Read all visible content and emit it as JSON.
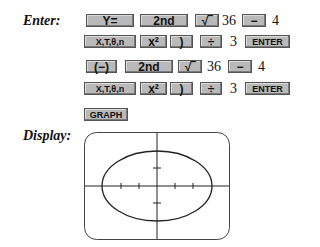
{
  "labels": {
    "enter": "Enter:",
    "display": "Display:"
  },
  "rows": [
    [
      {
        "type": "key",
        "label": "Y="
      },
      {
        "type": "key",
        "label": "2nd"
      },
      {
        "type": "key",
        "label": "√‾"
      },
      {
        "type": "text",
        "label": "36"
      },
      {
        "type": "key",
        "label": "−"
      },
      {
        "type": "text",
        "label": "4"
      }
    ],
    [
      {
        "type": "key",
        "label": "X,T,θ,n"
      },
      {
        "type": "key",
        "label": "x²"
      },
      {
        "type": "key",
        "label": ")"
      },
      {
        "type": "key",
        "label": "÷"
      },
      {
        "type": "text",
        "label": "3"
      },
      {
        "type": "key",
        "label": "ENTER"
      }
    ],
    [
      {
        "type": "key",
        "label": "(−)"
      },
      {
        "type": "key",
        "label": "2nd"
      },
      {
        "type": "key",
        "label": "√‾"
      },
      {
        "type": "text",
        "label": "36"
      },
      {
        "type": "key",
        "label": "−"
      },
      {
        "type": "text",
        "label": "4"
      }
    ],
    [
      {
        "type": "key",
        "label": "X,T,θ,n"
      },
      {
        "type": "key",
        "label": "x²"
      },
      {
        "type": "key",
        "label": ")"
      },
      {
        "type": "key",
        "label": "÷"
      },
      {
        "type": "text",
        "label": "3"
      },
      {
        "type": "key",
        "label": "ENTER"
      }
    ],
    [
      {
        "type": "key",
        "label": "GRAPH"
      }
    ]
  ],
  "display": {
    "graph": "ellipse",
    "x_ticks": [
      -2,
      -1,
      1,
      2
    ],
    "y_ticks": [
      -1,
      1
    ],
    "semi_axis_x": 3,
    "semi_axis_y": 2
  }
}
